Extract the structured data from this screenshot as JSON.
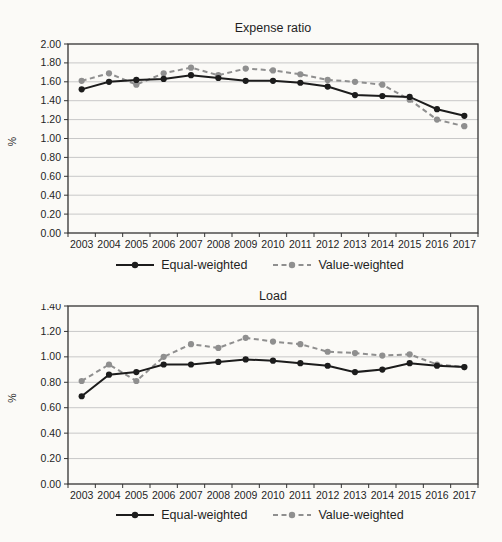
{
  "page": {
    "background_color": "#fbfaf7"
  },
  "colors": {
    "equal_weighted": "#1c1c1c",
    "value_weighted": "#8f8f8f",
    "gridline": "#c8c8c8",
    "axis": "#333333",
    "text": "#1f1f1f"
  },
  "chart_data": [
    {
      "type": "line",
      "title": "Expense ratio",
      "ylabel": "%",
      "ylim": [
        0.0,
        2.0
      ],
      "ytick_step": 0.2,
      "grid": true,
      "legend_position": "bottom",
      "categories": [
        "2003",
        "2004",
        "2005",
        "2006",
        "2007",
        "2008",
        "2009",
        "2010",
        "2011",
        "2012",
        "2013",
        "2014",
        "2015",
        "2016",
        "2017"
      ],
      "series": [
        {
          "name": "Equal-weighted",
          "line_style": "solid",
          "color": "#1c1c1c",
          "values": [
            1.52,
            1.6,
            1.62,
            1.63,
            1.67,
            1.64,
            1.61,
            1.61,
            1.59,
            1.55,
            1.46,
            1.45,
            1.44,
            1.31,
            1.24
          ]
        },
        {
          "name": "Value-weighted",
          "line_style": "dashed",
          "color": "#8f8f8f",
          "values": [
            1.61,
            1.69,
            1.57,
            1.69,
            1.75,
            1.67,
            1.74,
            1.72,
            1.68,
            1.62,
            1.6,
            1.57,
            1.41,
            1.2,
            1.13
          ]
        }
      ]
    },
    {
      "type": "line",
      "title": "Load",
      "ylabel": "%",
      "ylim": [
        0.0,
        1.4
      ],
      "ytick_step": 0.2,
      "grid": true,
      "legend_position": "bottom",
      "categories": [
        "2003",
        "2004",
        "2005",
        "2006",
        "2007",
        "2008",
        "2009",
        "2010",
        "2011",
        "2012",
        "2013",
        "2014",
        "2015",
        "2016",
        "2017"
      ],
      "series": [
        {
          "name": "Equal-weighted",
          "line_style": "solid",
          "color": "#1c1c1c",
          "values": [
            0.69,
            0.86,
            0.88,
            0.94,
            0.94,
            0.96,
            0.98,
            0.97,
            0.95,
            0.93,
            0.88,
            0.9,
            0.95,
            0.93,
            0.92
          ]
        },
        {
          "name": "Value-weighted",
          "line_style": "dashed",
          "color": "#8f8f8f",
          "values": [
            0.81,
            0.94,
            0.81,
            1.0,
            1.1,
            1.07,
            1.15,
            1.12,
            1.1,
            1.04,
            1.03,
            1.01,
            1.02,
            0.94,
            0.92
          ]
        }
      ]
    }
  ]
}
